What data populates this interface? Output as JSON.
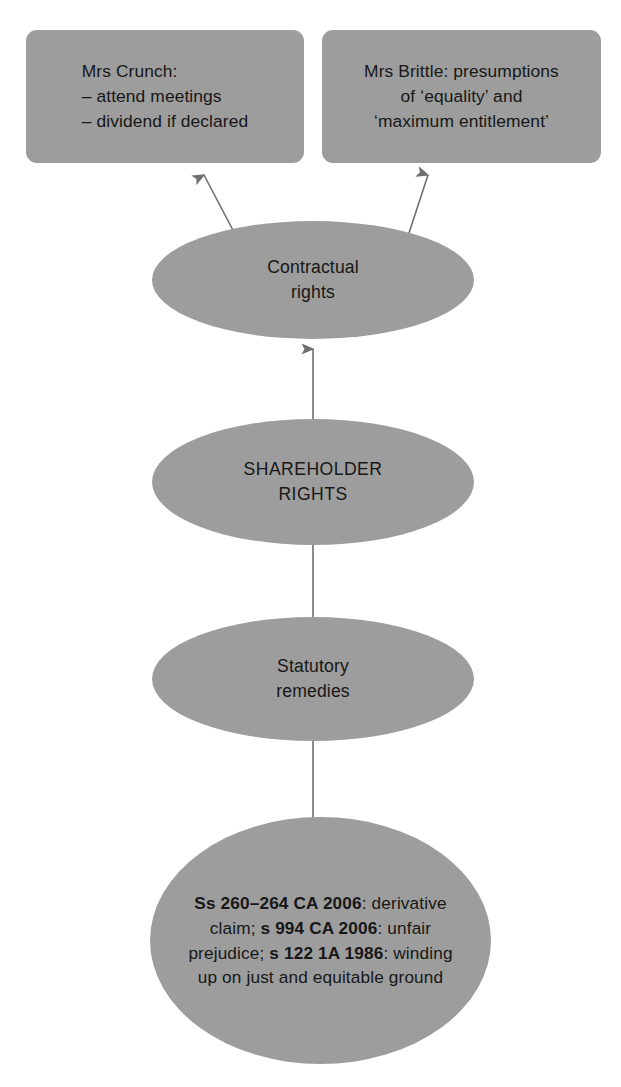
{
  "diagram": {
    "colors": {
      "node_fill": "#9d9d9d",
      "text": "#171717",
      "connector": "#6f6f6f",
      "background": "#ffffff"
    },
    "nodes": {
      "crunch_box": {
        "shape": "rounded-rectangle",
        "text": "Mrs Crunch:\n– attend meetings\n– dividend if declared"
      },
      "brittle_box": {
        "shape": "rounded-rectangle",
        "text": "Mrs Brittle: presumptions\nof ‘equality’ and\n‘maximum entitlement’"
      },
      "contractual_rights": {
        "shape": "ellipse",
        "text": "Contractual\nrights"
      },
      "shareholder_rights": {
        "shape": "ellipse",
        "text": "SHAREHOLDER\nRIGHTS"
      },
      "statutory_remedies": {
        "shape": "ellipse",
        "text": "Statutory\nremedies"
      },
      "statutory_detail": {
        "shape": "ellipse",
        "segments": [
          {
            "text": "Ss 260–264 CA 2006",
            "bold": true
          },
          {
            "text": ": derivative claim; ",
            "bold": false
          },
          {
            "text": "s 994 CA 2006",
            "bold": true
          },
          {
            "text": ": unfair prejudice; ",
            "bold": false
          },
          {
            "text": "s 122 1A 1986",
            "bold": true
          },
          {
            "text": ": winding up on just and equitable ground",
            "bold": false
          }
        ]
      }
    },
    "connectors": [
      {
        "name": "shareholder-to-contractual",
        "from": "shareholder_rights",
        "to": "contractual_rights",
        "direction": "up"
      },
      {
        "name": "shareholder-to-statutory",
        "from": "shareholder_rights",
        "to": "statutory_remedies",
        "direction": "down"
      },
      {
        "name": "statutory-to-detail",
        "from": "statutory_remedies",
        "to": "statutory_detail",
        "direction": "down"
      },
      {
        "name": "contractual-to-crunch",
        "from": "contractual_rights",
        "to": "crunch_box",
        "direction": "up-left"
      },
      {
        "name": "contractual-to-brittle",
        "from": "contractual_rights",
        "to": "brittle_box",
        "direction": "up-right"
      }
    ]
  }
}
